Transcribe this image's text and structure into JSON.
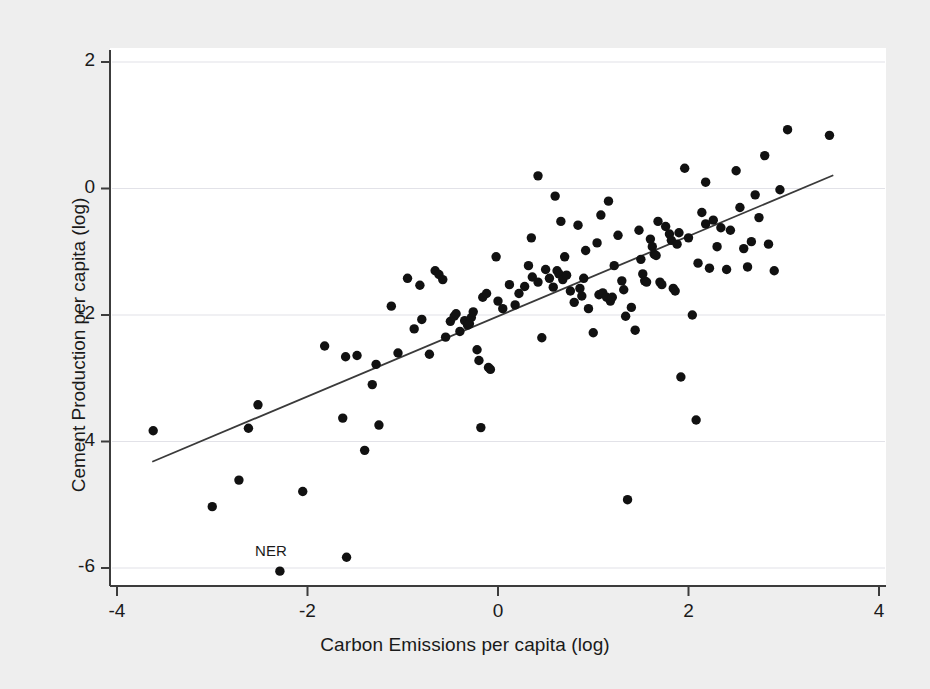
{
  "chart_data": {
    "type": "scatter",
    "title": "",
    "xlabel": "Carbon Emissions per capita (log)",
    "ylabel": "Cement Production per capita (log)",
    "xlim": [
      -4.2,
      4.2
    ],
    "ylim": [
      -6.35,
      2.3
    ],
    "xticks": [
      -4,
      -2,
      0,
      2,
      4
    ],
    "yticks": [
      2,
      0,
      -2,
      -4,
      -6
    ],
    "xtick_labels": [
      "-4",
      "-2",
      "0",
      "2",
      "4"
    ],
    "ytick_labels": [
      "2",
      "0",
      "-2",
      "-4",
      "-6"
    ],
    "grid": true,
    "grid_axis": "y",
    "legend": null,
    "marker": {
      "shape": "circle",
      "color": "#111111",
      "size": 7
    },
    "fit_line": {
      "type": "linear-fit",
      "color": "#3a3a3a",
      "x": [
        -3.63,
        3.52
      ],
      "y": [
        -4.32,
        0.21
      ]
    },
    "annotations": [
      {
        "text": "NER",
        "x": -2.55,
        "y": -5.74,
        "point_x": -2.29,
        "point_y": -6.05
      }
    ],
    "points": [
      [
        -3.62,
        -3.83
      ],
      [
        -3.0,
        -5.03
      ],
      [
        -2.72,
        -4.61
      ],
      [
        -2.62,
        -3.79
      ],
      [
        -2.52,
        -3.42
      ],
      [
        -2.29,
        -6.05
      ],
      [
        -2.05,
        -4.79
      ],
      [
        -1.82,
        -2.49
      ],
      [
        -1.63,
        -3.63
      ],
      [
        -1.6,
        -2.66
      ],
      [
        -1.59,
        -5.83
      ],
      [
        -1.48,
        -2.64
      ],
      [
        -1.4,
        -4.14
      ],
      [
        -1.32,
        -3.1
      ],
      [
        -1.28,
        -2.78
      ],
      [
        -1.25,
        -3.74
      ],
      [
        -1.12,
        -1.86
      ],
      [
        -1.05,
        -2.6
      ],
      [
        -0.95,
        -1.42
      ],
      [
        -0.88,
        -2.22
      ],
      [
        -0.82,
        -1.53
      ],
      [
        -0.8,
        -2.07
      ],
      [
        -0.72,
        -2.62
      ],
      [
        -0.66,
        -1.3
      ],
      [
        -0.62,
        -1.36
      ],
      [
        -0.58,
        -1.44
      ],
      [
        -0.55,
        -2.35
      ],
      [
        -0.5,
        -2.1
      ],
      [
        -0.46,
        -2.02
      ],
      [
        -0.44,
        -1.98
      ],
      [
        -0.4,
        -2.26
      ],
      [
        -0.35,
        -2.09
      ],
      [
        -0.32,
        -2.16
      ],
      [
        -0.3,
        -2.14
      ],
      [
        -0.28,
        -2.04
      ],
      [
        -0.26,
        -1.95
      ],
      [
        -0.22,
        -2.55
      ],
      [
        -0.2,
        -2.72
      ],
      [
        -0.18,
        -3.78
      ],
      [
        -0.16,
        -1.72
      ],
      [
        -0.12,
        -1.66
      ],
      [
        -0.1,
        -2.83
      ],
      [
        -0.08,
        -2.86
      ],
      [
        0.0,
        -1.78
      ],
      [
        0.05,
        -1.9
      ],
      [
        0.12,
        -1.52
      ],
      [
        0.18,
        -1.84
      ],
      [
        0.22,
        -1.66
      ],
      [
        0.28,
        -1.55
      ],
      [
        0.32,
        -1.22
      ],
      [
        0.36,
        -1.4
      ],
      [
        0.42,
        -1.48
      ],
      [
        0.46,
        -2.36
      ],
      [
        0.5,
        -1.28
      ],
      [
        0.54,
        -1.42
      ],
      [
        0.58,
        -1.56
      ],
      [
        0.6,
        -0.12
      ],
      [
        0.62,
        -1.3
      ],
      [
        0.64,
        -1.35
      ],
      [
        0.68,
        -1.44
      ],
      [
        0.7,
        -1.08
      ],
      [
        0.72,
        -1.37
      ],
      [
        0.76,
        -1.62
      ],
      [
        0.8,
        -1.8
      ],
      [
        0.84,
        -0.58
      ],
      [
        0.86,
        -1.58
      ],
      [
        0.88,
        -1.7
      ],
      [
        0.9,
        -1.42
      ],
      [
        0.95,
        -1.9
      ],
      [
        1.0,
        -2.28
      ],
      [
        1.04,
        -0.86
      ],
      [
        1.06,
        -1.68
      ],
      [
        1.1,
        -1.65
      ],
      [
        1.14,
        -1.72
      ],
      [
        1.18,
        -1.78
      ],
      [
        1.2,
        -1.72
      ],
      [
        1.22,
        -1.22
      ],
      [
        1.26,
        -0.74
      ],
      [
        1.3,
        -1.46
      ],
      [
        1.32,
        -1.6
      ],
      [
        1.34,
        -2.02
      ],
      [
        1.36,
        -4.92
      ],
      [
        1.4,
        -1.88
      ],
      [
        1.44,
        -2.24
      ],
      [
        1.48,
        -0.66
      ],
      [
        1.5,
        -1.12
      ],
      [
        1.52,
        -1.35
      ],
      [
        1.54,
        -1.46
      ],
      [
        1.56,
        -1.48
      ],
      [
        1.6,
        -0.8
      ],
      [
        1.62,
        -0.92
      ],
      [
        1.64,
        -1.04
      ],
      [
        1.66,
        -1.06
      ],
      [
        1.68,
        -0.52
      ],
      [
        1.7,
        -1.48
      ],
      [
        1.72,
        -1.52
      ],
      [
        1.76,
        -0.6
      ],
      [
        1.8,
        -0.72
      ],
      [
        1.82,
        -0.82
      ],
      [
        1.84,
        -1.58
      ],
      [
        1.86,
        -1.62
      ],
      [
        1.88,
        -0.88
      ],
      [
        1.9,
        -0.7
      ],
      [
        1.92,
        -2.98
      ],
      [
        1.96,
        0.32
      ],
      [
        2.0,
        -0.78
      ],
      [
        2.04,
        -2.0
      ],
      [
        2.08,
        -3.66
      ],
      [
        2.1,
        -1.18
      ],
      [
        2.14,
        -0.38
      ],
      [
        2.18,
        -0.56
      ],
      [
        2.22,
        -1.26
      ],
      [
        2.26,
        -0.5
      ],
      [
        2.3,
        -0.92
      ],
      [
        2.34,
        -0.62
      ],
      [
        2.4,
        -1.28
      ],
      [
        2.44,
        -0.66
      ],
      [
        2.5,
        0.28
      ],
      [
        2.54,
        -0.3
      ],
      [
        2.58,
        -0.95
      ],
      [
        2.62,
        -1.24
      ],
      [
        2.66,
        -0.84
      ],
      [
        2.7,
        -0.1
      ],
      [
        2.74,
        -0.46
      ],
      [
        2.8,
        0.52
      ],
      [
        2.84,
        -0.88
      ],
      [
        2.9,
        -1.3
      ],
      [
        2.96,
        -0.02
      ],
      [
        3.04,
        0.93
      ],
      [
        3.48,
        0.84
      ],
      [
        0.42,
        0.2
      ],
      [
        -0.02,
        -1.08
      ],
      [
        0.35,
        -0.78
      ],
      [
        1.08,
        -0.42
      ],
      [
        0.66,
        -0.52
      ],
      [
        1.16,
        -0.2
      ],
      [
        2.18,
        0.1
      ],
      [
        0.92,
        -0.98
      ]
    ]
  }
}
